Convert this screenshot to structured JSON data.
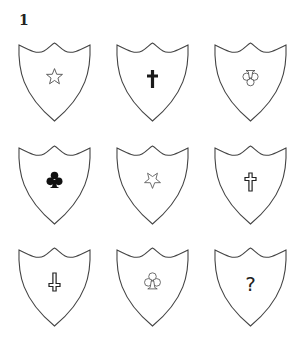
{
  "puzzle": {
    "label": "1",
    "grid": {
      "rows": 3,
      "cols": 3,
      "cells": [
        {
          "row": 1,
          "col": 1,
          "symbol": "star",
          "style": "outline",
          "orientation": "upright"
        },
        {
          "row": 1,
          "col": 2,
          "symbol": "latin-cross",
          "style": "filled",
          "orientation": "upright"
        },
        {
          "row": 1,
          "col": 3,
          "symbol": "club",
          "style": "outline",
          "orientation": "inverted"
        },
        {
          "row": 2,
          "col": 1,
          "symbol": "club",
          "style": "filled",
          "orientation": "upright"
        },
        {
          "row": 2,
          "col": 2,
          "symbol": "star",
          "style": "outline",
          "orientation": "inverted"
        },
        {
          "row": 2,
          "col": 3,
          "symbol": "latin-cross",
          "style": "outline",
          "orientation": "upright"
        },
        {
          "row": 3,
          "col": 1,
          "symbol": "latin-cross",
          "style": "outline",
          "orientation": "inverted"
        },
        {
          "row": 3,
          "col": 2,
          "symbol": "club",
          "style": "outline",
          "orientation": "upright"
        },
        {
          "row": 3,
          "col": 3,
          "symbol": "question-mark",
          "text": "?"
        }
      ]
    },
    "colors": {
      "stroke": "#444444",
      "symbol": "#1a1a1a",
      "background": "#ffffff"
    }
  }
}
